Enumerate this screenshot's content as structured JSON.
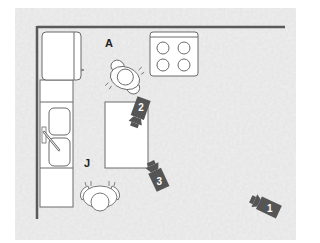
{
  "diagram": {
    "type": "floor-plan",
    "colors": {
      "background_panel": "#e6e6e6",
      "wall": "#5a5a5a",
      "fixture_stroke": "#6a6a6a",
      "fixture_fill": "#ffffff",
      "camera": "#555555",
      "camera_number": "#ffffff"
    },
    "people": [
      {
        "label": "A",
        "position": "between fridge and stove, above island"
      },
      {
        "label": "J",
        "position": "below island, beside counter"
      }
    ],
    "cameras": [
      {
        "number": "1",
        "position": "lower right"
      },
      {
        "number": "2",
        "position": "upper right corner of island"
      },
      {
        "number": "3",
        "position": "lower right of island"
      }
    ],
    "fixtures": [
      "refrigerator",
      "stove-4-burner",
      "counter",
      "double-sink",
      "island"
    ]
  }
}
